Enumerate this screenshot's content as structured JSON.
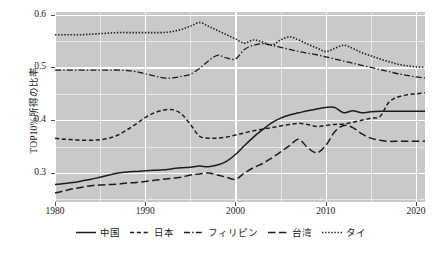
{
  "chart_data": {
    "type": "line",
    "title": "",
    "xlabel": "",
    "ylabel": "TOP10%所得の比率",
    "xlim": [
      1980,
      2021
    ],
    "ylim": [
      0.245,
      0.605
    ],
    "grid": true,
    "legend_position": "bottom",
    "x_ticks": [
      "1980",
      "1990",
      "2000",
      "2010",
      "2020"
    ],
    "x_tick_values": [
      1980,
      1990,
      2000,
      2010,
      2020
    ],
    "y_ticks": [
      "0.3",
      "0.4",
      "0.5",
      "0.6"
    ],
    "y_tick_values": [
      0.3,
      0.4,
      0.5,
      0.6
    ],
    "x": [
      1980,
      1981,
      1982,
      1983,
      1984,
      1985,
      1986,
      1987,
      1988,
      1989,
      1990,
      1991,
      1992,
      1993,
      1994,
      1995,
      1996,
      1997,
      1998,
      1999,
      2000,
      2001,
      2002,
      2003,
      2004,
      2005,
      2006,
      2007,
      2008,
      2009,
      2010,
      2011,
      2012,
      2013,
      2014,
      2015,
      2016,
      2017,
      2018,
      2019,
      2020,
      2021
    ],
    "series": [
      {
        "name": "中国",
        "dash": "solid",
        "values": [
          0.278,
          0.28,
          0.282,
          0.285,
          0.288,
          0.292,
          0.296,
          0.3,
          0.302,
          0.303,
          0.304,
          0.305,
          0.306,
          0.308,
          0.31,
          0.311,
          0.313,
          0.312,
          0.315,
          0.322,
          0.335,
          0.352,
          0.368,
          0.382,
          0.395,
          0.404,
          0.41,
          0.414,
          0.418,
          0.421,
          0.424,
          0.424,
          0.414,
          0.418,
          0.414,
          0.416,
          0.417,
          0.417,
          0.417,
          0.417,
          0.417,
          0.417
        ]
      },
      {
        "name": "日本",
        "dash": "dashed",
        "values": [
          0.366,
          0.364,
          0.363,
          0.362,
          0.362,
          0.363,
          0.366,
          0.372,
          0.382,
          0.393,
          0.405,
          0.414,
          0.419,
          0.42,
          0.412,
          0.392,
          0.37,
          0.366,
          0.366,
          0.368,
          0.372,
          0.376,
          0.38,
          0.383,
          0.386,
          0.389,
          0.392,
          0.394,
          0.392,
          0.388,
          0.39,
          0.392,
          0.393,
          0.396,
          0.4,
          0.404,
          0.407,
          0.434,
          0.444,
          0.448,
          0.45,
          0.452
        ]
      },
      {
        "name": "フィリピン",
        "dash": "dashdot",
        "values": [
          0.495,
          0.495,
          0.495,
          0.495,
          0.495,
          0.495,
          0.495,
          0.495,
          0.494,
          0.492,
          0.488,
          0.484,
          0.48,
          0.48,
          0.483,
          0.487,
          0.498,
          0.512,
          0.523,
          0.518,
          0.516,
          0.534,
          0.542,
          0.545,
          0.542,
          0.538,
          0.534,
          0.53,
          0.527,
          0.524,
          0.52,
          0.516,
          0.512,
          0.508,
          0.504,
          0.5,
          0.496,
          0.492,
          0.488,
          0.485,
          0.482,
          0.48
        ]
      },
      {
        "name": "台湾",
        "dash": "longdash",
        "values": [
          0.262,
          0.266,
          0.27,
          0.273,
          0.276,
          0.277,
          0.278,
          0.279,
          0.281,
          0.282,
          0.284,
          0.286,
          0.288,
          0.29,
          0.292,
          0.296,
          0.298,
          0.3,
          0.296,
          0.292,
          0.288,
          0.3,
          0.31,
          0.318,
          0.328,
          0.34,
          0.352,
          0.364,
          0.348,
          0.338,
          0.352,
          0.378,
          0.39,
          0.386,
          0.374,
          0.366,
          0.362,
          0.36,
          0.36,
          0.36,
          0.36,
          0.36
        ]
      },
      {
        "name": "タイ",
        "dash": "dotted",
        "values": [
          0.562,
          0.562,
          0.562,
          0.562,
          0.563,
          0.564,
          0.565,
          0.566,
          0.566,
          0.566,
          0.566,
          0.566,
          0.566,
          0.568,
          0.572,
          0.578,
          0.585,
          0.578,
          0.57,
          0.562,
          0.554,
          0.546,
          0.552,
          0.548,
          0.542,
          0.552,
          0.558,
          0.552,
          0.544,
          0.537,
          0.53,
          0.536,
          0.542,
          0.536,
          0.528,
          0.522,
          0.516,
          0.511,
          0.506,
          0.503,
          0.501,
          0.5
        ]
      }
    ]
  },
  "legend": {
    "items": [
      {
        "label": "中国"
      },
      {
        "label": "日本"
      },
      {
        "label": "フィリピン"
      },
      {
        "label": "台湾"
      },
      {
        "label": "タイ"
      }
    ]
  },
  "colors": {
    "panel_background": "#c9c9c9",
    "grid": "#ffffff",
    "line": "#1c1c1c",
    "text": "#1a1a1a"
  }
}
